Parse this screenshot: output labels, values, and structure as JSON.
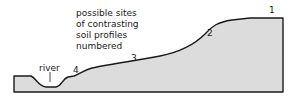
{
  "diagram": {
    "caption": "possible sites\nof contrasting\nsoil profiles\nnumbered",
    "river_label": "river",
    "sites": [
      {
        "number": "1"
      },
      {
        "number": "2"
      },
      {
        "number": "3"
      },
      {
        "number": "4"
      }
    ],
    "colors": {
      "fill": "#dcdcdc",
      "outline": "#1a1a1a"
    }
  }
}
